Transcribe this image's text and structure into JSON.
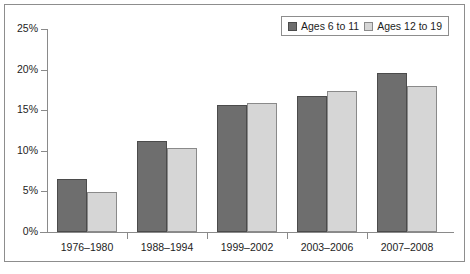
{
  "chart_data": {
    "type": "bar",
    "title": "",
    "subtitle": "",
    "xlabel": "",
    "ylabel": "",
    "categories": [
      "1976–1980",
      "1988–1994",
      "1999–2002",
      "2003–2006",
      "2007–2008"
    ],
    "series": [
      {
        "name": "Ages 6 to 11",
        "color": "#6e6e6e",
        "values": [
          6.5,
          11.2,
          15.7,
          16.8,
          19.6
        ]
      },
      {
        "name": "Ages 12 to 19",
        "color": "#d6d6d6",
        "values": [
          4.9,
          10.4,
          15.9,
          17.4,
          18.0
        ]
      }
    ],
    "ylim": [
      0,
      25
    ],
    "yticks": [
      0,
      5,
      10,
      15,
      20,
      25
    ],
    "ytick_labels": [
      "0%",
      "5%",
      "10%",
      "15%",
      "20%",
      "25%"
    ],
    "grid": false,
    "legend_position": "top-right"
  },
  "legend": {
    "items": [
      {
        "label": "Ages 6 to 11"
      },
      {
        "label": "Ages 12 to 19"
      }
    ]
  },
  "colors": {
    "series_dark": "#6e6e6e",
    "series_light": "#d6d6d6",
    "axis": "#8a8a8a",
    "frame": "#8d8d8d",
    "text": "#1d1d1d",
    "background": "#ffffff"
  }
}
